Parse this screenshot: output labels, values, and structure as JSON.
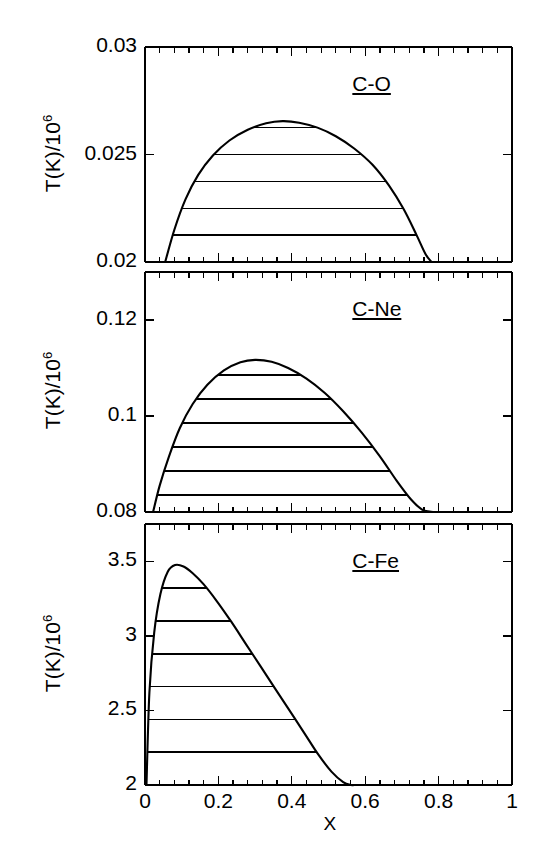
{
  "figure": {
    "width": 545,
    "height": 853,
    "background": "#ffffff",
    "ink": "#000000",
    "xaxis": {
      "label": "X",
      "min": 0,
      "max": 1,
      "ticks": [
        0,
        0.2,
        0.4,
        0.6,
        0.8,
        1
      ],
      "tick_labels": [
        "0",
        "0.2",
        "0.4",
        "0.6",
        "0.8",
        "1"
      ],
      "minor_per_major": 5
    },
    "panels": [
      {
        "id": "c-o",
        "label": "C-O",
        "ylabel": "T(K)/10",
        "ylabel_exp": "6",
        "ymin": 0.02,
        "ymax": 0.03,
        "yticks": [
          0.02,
          0.025,
          0.03
        ],
        "ytick_labels": [
          "0.02",
          "0.025",
          "0.03"
        ],
        "minor_per_major": 5
      },
      {
        "id": "c-ne",
        "label": "C-Ne",
        "ylabel": "T(K)/10",
        "ylabel_exp": "6",
        "ymin": 0.08,
        "ymax": 0.13,
        "yticks": [
          0.08,
          0.1,
          0.12
        ],
        "ytick_labels": [
          "0.08",
          "0.1",
          "0.12"
        ],
        "minor_per_major": 4
      },
      {
        "id": "c-fe",
        "label": "C-Fe",
        "ylabel": "T(K)/10",
        "ylabel_exp": "6",
        "ymin": 2,
        "ymax": 3.75,
        "yticks": [
          2,
          2.5,
          3,
          3.5
        ],
        "ytick_labels": [
          "2",
          "2.5",
          "3",
          "3.5"
        ],
        "minor_per_major": 5
      }
    ]
  },
  "chart_data": [
    {
      "type": "area",
      "title": "C-O",
      "xlabel": "X",
      "ylabel": "T(K)/10^6",
      "xlim": [
        0,
        1
      ],
      "ylim": [
        0.02,
        0.03
      ],
      "grid": false,
      "legend": "none",
      "annotation": "C-O",
      "series": [
        {
          "name": "miscibility gap boundary",
          "x": [
            0.055,
            0.08,
            0.11,
            0.145,
            0.185,
            0.23,
            0.28,
            0.33,
            0.375,
            0.42,
            0.47,
            0.52,
            0.57,
            0.62,
            0.665,
            0.705,
            0.74,
            0.765,
            0.781
          ],
          "y": [
            0.02,
            0.0215,
            0.0229,
            0.02405,
            0.02495,
            0.02565,
            0.02615,
            0.02645,
            0.02655,
            0.02648,
            0.02625,
            0.02585,
            0.02528,
            0.02452,
            0.02355,
            0.02245,
            0.02125,
            0.02035,
            0.02
          ]
        }
      ],
      "hatch_lines_y": [
        0.02125,
        0.0225,
        0.02375,
        0.025,
        0.02625
      ],
      "peak": {
        "x": 0.375,
        "y": 0.02655
      }
    },
    {
      "type": "area",
      "title": "C-Ne",
      "xlabel": "X",
      "ylabel": "T(K)/10^6",
      "xlim": [
        0,
        1
      ],
      "ylim": [
        0.08,
        0.13
      ],
      "grid": false,
      "legend": "none",
      "annotation": "C-Ne",
      "series": [
        {
          "name": "miscibility gap boundary",
          "x": [
            0.022,
            0.04,
            0.065,
            0.095,
            0.13,
            0.17,
            0.215,
            0.26,
            0.3,
            0.345,
            0.39,
            0.44,
            0.49,
            0.54,
            0.59,
            0.64,
            0.685,
            0.725,
            0.755,
            0.775,
            0.787
          ],
          "y": [
            0.08,
            0.0855,
            0.0915,
            0.0975,
            0.1025,
            0.1065,
            0.1095,
            0.1112,
            0.1117,
            0.1113,
            0.11,
            0.1078,
            0.1048,
            0.101,
            0.0966,
            0.0916,
            0.0866,
            0.0826,
            0.0805,
            0.0801,
            0.08
          ]
        }
      ],
      "hatch_lines_y": [
        0.0835,
        0.0885,
        0.0935,
        0.0985,
        0.1035,
        0.1085
      ],
      "peak": {
        "x": 0.3,
        "y": 0.1117
      }
    },
    {
      "type": "area",
      "title": "C-Fe",
      "xlabel": "X",
      "ylabel": "T(K)/10^6",
      "xlim": [
        0,
        1
      ],
      "ylim": [
        2,
        3.75
      ],
      "grid": false,
      "legend": "none",
      "annotation": "C-Fe",
      "series": [
        {
          "name": "miscibility gap boundary",
          "x": [
            0.004,
            0.012,
            0.025,
            0.042,
            0.062,
            0.082,
            0.105,
            0.13,
            0.16,
            0.195,
            0.235,
            0.275,
            0.315,
            0.355,
            0.395,
            0.435,
            0.472,
            0.508,
            0.54,
            0.562,
            0.572
          ],
          "y": [
            2.0,
            2.62,
            3.02,
            3.28,
            3.43,
            3.475,
            3.465,
            3.42,
            3.345,
            3.235,
            3.095,
            2.945,
            2.795,
            2.645,
            2.495,
            2.345,
            2.205,
            2.09,
            2.02,
            2.0,
            2.0
          ]
        }
      ],
      "hatch_lines_y": [
        2.22,
        2.44,
        2.66,
        2.88,
        3.1,
        3.32
      ],
      "peak": {
        "x": 0.082,
        "y": 3.475
      }
    }
  ]
}
